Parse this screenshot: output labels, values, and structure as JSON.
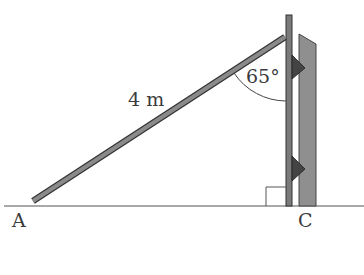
{
  "diagram": {
    "labels": {
      "point_a": "A",
      "point_c": "C",
      "ladder_length": "4 m",
      "angle": "65°"
    },
    "colors": {
      "ladder_fill": "#8a8a8a",
      "ladder_outline": "#3a3a3a",
      "pole_fill": "#7a7a7a",
      "wall_fill": "#8f8f8f",
      "bracket_fill": "#444444",
      "ground": "#555555",
      "text": "#3a3a3a"
    },
    "geometry": {
      "ladder_length_m": 4,
      "angle_at_top_deg": 65,
      "right_angle_at": "C"
    }
  }
}
